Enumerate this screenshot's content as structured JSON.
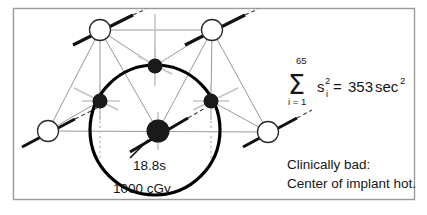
{
  "figure": {
    "frame": {
      "border_color": "#9a9a9a",
      "background_color": "#ffffff"
    },
    "colors": {
      "thin_line": "#8d8d8d",
      "faint_line": "#bdbdbd",
      "source_line": "#111111",
      "dot_fill": "#1a1a1a",
      "open_circle_stroke": "#2b2b2b",
      "isodose_stroke": "#000000",
      "text": "#161616"
    },
    "labels": {
      "center_dwell_time": "18.8s",
      "isodose_value": "1000 cGy"
    },
    "equation": {
      "sum_symbol": "Σ",
      "upper_limit": "65",
      "lower_limit": "i = 1",
      "variable": "s",
      "variable_superscript": "2",
      "variable_subscript": "i",
      "equals": "=",
      "result_value": "353",
      "result_unit": "sec",
      "result_unit_superscript": "2",
      "plain_text": "Σ (i = 1 to 65) s²ᵢ = 353 sec²"
    },
    "annotation": {
      "line1": "Clinically bad:",
      "line2": "Center of implant hot."
    },
    "geometry": {
      "open_circles": [
        {
          "name": "catheter-top-left",
          "cx": 100,
          "cy": 30,
          "r": 10.5
        },
        {
          "name": "catheter-top-right",
          "cx": 212,
          "cy": 30,
          "r": 10.5
        },
        {
          "name": "catheter-bottom-left",
          "cx": 48,
          "cy": 131,
          "r": 10.5
        },
        {
          "name": "catheter-bottom-right",
          "cx": 268,
          "cy": 132,
          "r": 10.5
        }
      ],
      "filled_dots": [
        {
          "name": "source-dot-top",
          "cx": 155,
          "cy": 66,
          "r": 7.5
        },
        {
          "name": "source-dot-left",
          "cx": 100,
          "cy": 101,
          "r": 7.5
        },
        {
          "name": "source-dot-right",
          "cx": 211,
          "cy": 101,
          "r": 7.5
        },
        {
          "name": "source-dot-center",
          "cx": 158,
          "cy": 131,
          "r": 11.5
        }
      ],
      "isodose_circle": {
        "cx": 155,
        "cy": 130,
        "r": 65,
        "stroke_width": 3.2
      }
    }
  }
}
